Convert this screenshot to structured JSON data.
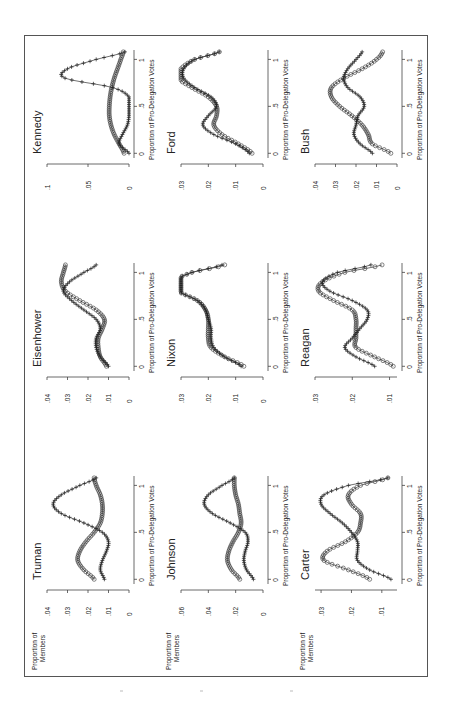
{
  "figure": {
    "y_axis_label_line1": "Proportion of",
    "y_axis_label_line2": "Members",
    "x_axis_label": "Proportion of Pro-Delegation Votes",
    "x_ticks": [
      "0",
      ".5",
      "1"
    ],
    "series_markers": {
      "circle": "o",
      "plus": "+"
    }
  },
  "chart_data": [
    {
      "type": "line",
      "title": "Truman",
      "xlabel": "Proportion of Pro-Delegation Votes",
      "ylabel": "Proportion of Members",
      "ylim": [
        0,
        0.04
      ],
      "y_ticks": [
        "0",
        ".01",
        ".02",
        ".03",
        ".04"
      ],
      "x": [
        0,
        0.1,
        0.2,
        0.3,
        0.4,
        0.5,
        0.6,
        0.7,
        0.8,
        0.9,
        1.0,
        1.08
      ],
      "series": [
        {
          "name": "circle",
          "values": [
            0.017,
            0.022,
            0.025,
            0.024,
            0.021,
            0.017,
            0.014,
            0.013,
            0.013,
            0.014,
            0.016,
            0.017
          ]
        },
        {
          "name": "plus",
          "values": [
            0.012,
            0.014,
            0.013,
            0.011,
            0.01,
            0.013,
            0.022,
            0.033,
            0.037,
            0.033,
            0.024,
            0.016
          ]
        }
      ]
    },
    {
      "type": "line",
      "title": "Eisenhower",
      "xlabel": "Proportion of Pro-Delegation Votes",
      "ylabel": "",
      "ylim": [
        0,
        0.04
      ],
      "y_ticks": [
        "0",
        ".01",
        ".02",
        ".03",
        ".04"
      ],
      "x": [
        0,
        0.1,
        0.2,
        0.3,
        0.4,
        0.5,
        0.6,
        0.7,
        0.8,
        0.9,
        1.0,
        1.08
      ],
      "series": [
        {
          "name": "circle",
          "values": [
            0.011,
            0.014,
            0.015,
            0.015,
            0.013,
            0.012,
            0.016,
            0.024,
            0.031,
            0.033,
            0.032,
            0.031
          ]
        },
        {
          "name": "plus",
          "values": [
            0.01,
            0.014,
            0.016,
            0.016,
            0.014,
            0.016,
            0.022,
            0.028,
            0.032,
            0.029,
            0.022,
            0.016
          ]
        }
      ]
    },
    {
      "type": "line",
      "title": "Kennedy",
      "xlabel": "Proportion of Pro-Delegation Votes",
      "ylabel": "",
      "ylim": [
        0,
        0.1
      ],
      "y_ticks": [
        "0",
        ".05",
        ".1"
      ],
      "x": [
        0,
        0.1,
        0.2,
        0.3,
        0.4,
        0.5,
        0.6,
        0.7,
        0.8,
        0.9,
        1.0,
        1.08
      ],
      "series": [
        {
          "name": "circle",
          "values": [
            0.006,
            0.012,
            0.018,
            0.022,
            0.024,
            0.024,
            0.023,
            0.021,
            0.018,
            0.014,
            0.01,
            0.007
          ]
        },
        {
          "name": "plus",
          "values": [
            0.0,
            0.012,
            0.008,
            0.002,
            0.0,
            0.0,
            0.0,
            0.02,
            0.078,
            0.075,
            0.04,
            0.005
          ]
        }
      ]
    },
    {
      "type": "line",
      "title": "Johnson",
      "xlabel": "Proportion of Pro-Delegation Votes",
      "ylabel": "Proportion of Members",
      "ylim": [
        0,
        0.06
      ],
      "y_ticks": [
        "0",
        ".02",
        ".04",
        ".06"
      ],
      "x": [
        0,
        0.1,
        0.2,
        0.3,
        0.4,
        0.5,
        0.6,
        0.7,
        0.8,
        0.9,
        1.0,
        1.08
      ],
      "series": [
        {
          "name": "circle",
          "values": [
            0.017,
            0.023,
            0.026,
            0.025,
            0.022,
            0.018,
            0.016,
            0.017,
            0.018,
            0.02,
            0.021,
            0.021
          ]
        },
        {
          "name": "plus",
          "values": [
            0.007,
            0.012,
            0.014,
            0.013,
            0.011,
            0.013,
            0.024,
            0.037,
            0.043,
            0.04,
            0.03,
            0.021
          ]
        }
      ]
    },
    {
      "type": "line",
      "title": "Nixon",
      "xlabel": "Proportion of Pro-Delegation Votes",
      "ylabel": "",
      "ylim": [
        0,
        0.03
      ],
      "y_ticks": [
        "0",
        ".01",
        ".02",
        ".03"
      ],
      "x": [
        0,
        0.1,
        0.2,
        0.3,
        0.4,
        0.5,
        0.6,
        0.7,
        0.8,
        0.9,
        1.0,
        1.08
      ],
      "series": [
        {
          "name": "circle",
          "values": [
            0.007,
            0.014,
            0.019,
            0.02,
            0.02,
            0.02,
            0.021,
            0.024,
            0.031,
            0.033,
            0.026,
            0.014
          ]
        },
        {
          "name": "plus",
          "values": [
            0.008,
            0.014,
            0.018,
            0.019,
            0.019,
            0.02,
            0.021,
            0.024,
            0.031,
            0.033,
            0.026,
            0.015
          ]
        }
      ]
    },
    {
      "type": "line",
      "title": "Ford",
      "xlabel": "Proportion of Pro-Delegation Votes",
      "ylabel": "",
      "ylim": [
        0,
        0.03
      ],
      "y_ticks": [
        "0",
        ".01",
        ".02",
        ".03"
      ],
      "x": [
        0,
        0.1,
        0.2,
        0.3,
        0.4,
        0.5,
        0.6,
        0.7,
        0.8,
        0.9,
        1.0,
        1.08
      ],
      "series": [
        {
          "name": "circle",
          "values": [
            0.004,
            0.009,
            0.015,
            0.018,
            0.017,
            0.017,
            0.02,
            0.026,
            0.031,
            0.03,
            0.025,
            0.016
          ]
        },
        {
          "name": "plus",
          "values": [
            0.005,
            0.01,
            0.018,
            0.022,
            0.02,
            0.017,
            0.019,
            0.025,
            0.029,
            0.029,
            0.025,
            0.016
          ]
        }
      ]
    },
    {
      "type": "line",
      "title": "Carter",
      "xlabel": "Proportion of Pro-Delegation Votes",
      "ylabel": "Proportion of Members",
      "ylim": [
        0.005,
        0.032
      ],
      "y_ticks": [
        ".01",
        ".02",
        ".03"
      ],
      "x": [
        0,
        0.1,
        0.2,
        0.3,
        0.4,
        0.5,
        0.6,
        0.7,
        0.8,
        0.9,
        1.0,
        1.08
      ],
      "series": [
        {
          "name": "circle",
          "values": [
            0.014,
            0.021,
            0.029,
            0.028,
            0.022,
            0.018,
            0.017,
            0.017,
            0.02,
            0.021,
            0.017,
            0.008
          ]
        },
        {
          "name": "plus",
          "values": [
            0.007,
            0.014,
            0.018,
            0.018,
            0.018,
            0.02,
            0.023,
            0.027,
            0.03,
            0.029,
            0.021,
            0.008
          ]
        }
      ]
    },
    {
      "type": "line",
      "title": "Reagan",
      "xlabel": "Proportion of Pro-Delegation Votes",
      "ylabel": "",
      "ylim": [
        0.008,
        0.03
      ],
      "y_ticks": [
        ".01",
        ".02",
        ".03"
      ],
      "x": [
        0,
        0.1,
        0.2,
        0.3,
        0.4,
        0.5,
        0.6,
        0.7,
        0.8,
        0.9,
        1.0,
        1.08
      ],
      "series": [
        {
          "name": "circle",
          "values": [
            0.009,
            0.014,
            0.019,
            0.019,
            0.019,
            0.019,
            0.02,
            0.025,
            0.029,
            0.028,
            0.022,
            0.012
          ]
        },
        {
          "name": "plus",
          "values": [
            0.014,
            0.019,
            0.022,
            0.02,
            0.018,
            0.016,
            0.016,
            0.02,
            0.026,
            0.028,
            0.024,
            0.015
          ]
        }
      ]
    },
    {
      "type": "line",
      "title": "Bush",
      "xlabel": "Proportion of Pro-Delegation Votes",
      "ylabel": "",
      "ylim": [
        0,
        0.04
      ],
      "y_ticks": [
        "0",
        ".01",
        ".02",
        ".03",
        ".04"
      ],
      "x": [
        0,
        0.1,
        0.2,
        0.3,
        0.4,
        0.5,
        0.6,
        0.7,
        0.8,
        0.9,
        1.0,
        1.08
      ],
      "series": [
        {
          "name": "circle",
          "values": [
            0.003,
            0.012,
            0.014,
            0.017,
            0.022,
            0.028,
            0.032,
            0.032,
            0.026,
            0.017,
            0.01,
            0.007
          ]
        },
        {
          "name": "plus",
          "values": [
            0.012,
            0.018,
            0.021,
            0.02,
            0.019,
            0.016,
            0.018,
            0.024,
            0.026,
            0.024,
            0.02,
            0.017
          ]
        }
      ]
    }
  ]
}
